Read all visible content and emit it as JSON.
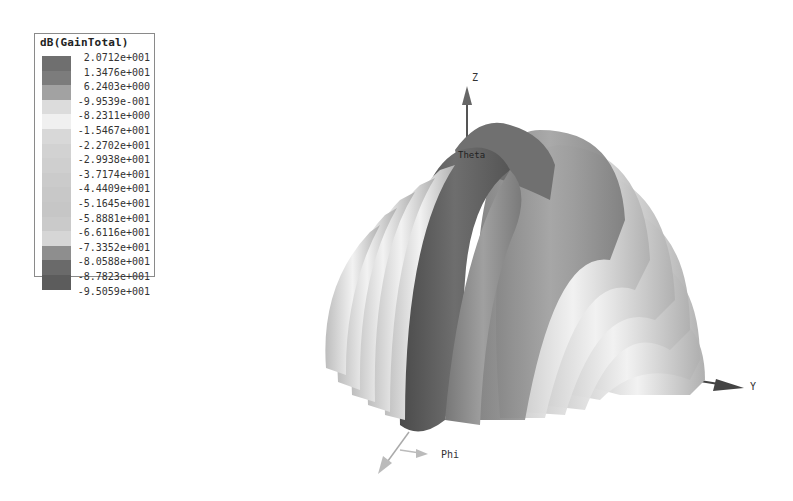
{
  "chart_data": {
    "type": "3d-radiation-pattern",
    "title": "dB(GainTotal)",
    "legend": {
      "title": "dB(GainTotal)",
      "position": "top-left",
      "values": [
        "2.0712e+001",
        "1.3476e+001",
        "6.2403e+000",
        "-9.9539e-001",
        "-8.2311e+000",
        "-1.5467e+001",
        "-2.2702e+001",
        "-2.9938e+001",
        "-3.7174e+001",
        "-4.4409e+001",
        "-5.1645e+001",
        "-5.8881e+001",
        "-6.6116e+001",
        "-7.3352e+001",
        "-8.0588e+001",
        "-8.7823e+001",
        "-9.5059e+001"
      ],
      "numeric_values": [
        20.712,
        13.476,
        6.2403,
        -0.99539,
        -8.2311,
        -15.467,
        -22.702,
        -29.938,
        -37.174,
        -44.409,
        -51.645,
        -58.881,
        -66.116,
        -73.352,
        -80.588,
        -87.823,
        -95.059
      ],
      "swatch_colors": [
        "#6f6f6f",
        "#7c7c7c",
        "#a2a2a2",
        "#dcdcdc",
        "#f0f0f0",
        "#d8d8d8",
        "#d2d2d2",
        "#cfcfcf",
        "#cbcbcb",
        "#c8c8c8",
        "#c6c6c6",
        "#cacaca",
        "#d6d6d6",
        "#8e8e8e",
        "#6a6a6a",
        "#5c5c5c"
      ]
    },
    "axes": {
      "z_label": "Z",
      "y_label": "Y",
      "phi_label": "Phi",
      "theta_label": "Theta"
    },
    "range_db": [
      -95.059,
      20.712
    ]
  },
  "legend_title": "dB(GainTotal)"
}
